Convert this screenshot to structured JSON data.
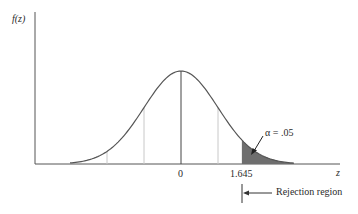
{
  "diagram": {
    "y_axis_label": "f(z)",
    "x_axis_label": "z",
    "tick_labels": {
      "zero": "0",
      "critical": "1.645"
    },
    "annotations": {
      "alpha": "α = .05",
      "rejection": "Rejection region"
    },
    "distribution": "standard normal",
    "critical_value": 1.645,
    "alpha": 0.05,
    "tail": "upper",
    "colors": {
      "curve": "#555555",
      "axis": "#555555",
      "gridline": "#c8c8c8",
      "shaded": "#6e6e6e",
      "text": "#2a2a2a"
    }
  }
}
